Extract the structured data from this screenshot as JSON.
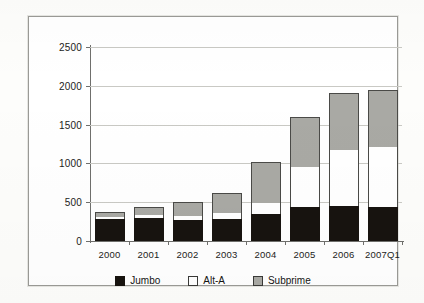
{
  "chart_data": {
    "type": "bar",
    "title": "",
    "xlabel": "",
    "ylabel": "",
    "stacked": true,
    "grid": true,
    "legend_position": "bottom",
    "ylim": [
      0,
      2500
    ],
    "yticks": [
      0,
      500,
      1000,
      1500,
      2000,
      2500
    ],
    "ytick_labels": [
      "0",
      "500",
      "1000",
      "1500",
      "2000",
      "2500"
    ],
    "categories": [
      "2000",
      "2001",
      "2002",
      "2003",
      "2004",
      "2005",
      "2006",
      "2007Q1"
    ],
    "series": [
      {
        "name": "Jumbo",
        "color": "#17130f",
        "values": [
          280,
          300,
          270,
          280,
          350,
          440,
          455,
          440
        ]
      },
      {
        "name": "Alt-A",
        "color": "#ffffff",
        "values": [
          25,
          30,
          55,
          80,
          145,
          515,
          720,
          775
        ]
      },
      {
        "name": "Subprime",
        "color": "#a9a9a4",
        "values": [
          70,
          110,
          175,
          255,
          520,
          645,
          735,
          735
        ]
      }
    ],
    "totals": [
      375,
      440,
      500,
      615,
      1015,
      1600,
      1910,
      1950
    ]
  },
  "legend": {
    "items": [
      {
        "label": "Jumbo",
        "swatch": "black-square-icon"
      },
      {
        "label": "Alt-A",
        "swatch": "white-square-icon"
      },
      {
        "label": "Subprime",
        "swatch": "gray-square-icon"
      }
    ]
  }
}
